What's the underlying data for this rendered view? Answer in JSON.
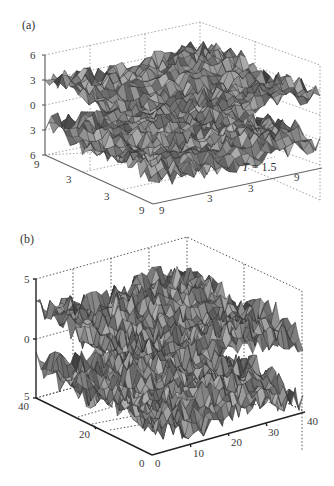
{
  "figure": {
    "panels": [
      "(a)",
      "(b)"
    ]
  },
  "chart_data": [
    {
      "type": "surface3d",
      "panel_label": "(a)",
      "title": "",
      "annotation": "T = 1.5",
      "annotation_italic_part": "T",
      "annotation_rest": " = 1.5",
      "z_ticks": [
        "6",
        "3",
        "0",
        "3",
        "6"
      ],
      "x_ticks": [
        "9",
        "3",
        "3",
        "9"
      ],
      "y_ticks": [
        "9",
        "3",
        "3",
        "9"
      ],
      "zlim": [
        -6,
        6
      ],
      "grid": true,
      "surfaces": [
        {
          "name": "upper-sheet",
          "mean_level": 2.5,
          "roughness": "high"
        },
        {
          "name": "lower-sheet",
          "mean_level": -3.0,
          "roughness": "high"
        }
      ],
      "colormap": "gray"
    },
    {
      "type": "surface3d",
      "panel_label": "(b)",
      "title": "",
      "z_ticks": [
        "5",
        "0",
        "5"
      ],
      "x_ticks": [
        "0",
        "10",
        "20",
        "30",
        "40"
      ],
      "y_ticks": [
        "40",
        "20",
        "0"
      ],
      "xlim": [
        0,
        40
      ],
      "ylim": [
        0,
        40
      ],
      "zlim": [
        -5,
        5
      ],
      "grid": true,
      "surfaces": [
        {
          "name": "upper-sheet",
          "mean_level": 2.0,
          "roughness": "high"
        },
        {
          "name": "lower-sheet",
          "mean_level": -3.0,
          "roughness": "high"
        }
      ],
      "colormap": "gray"
    }
  ]
}
